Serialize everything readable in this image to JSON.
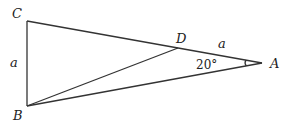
{
  "diagram": {
    "type": "geometry-triangle",
    "points": {
      "A": {
        "label": "A",
        "x": 262,
        "y": 63
      },
      "B": {
        "label": "B",
        "x": 27,
        "y": 106
      },
      "C": {
        "label": "C",
        "x": 27,
        "y": 21
      },
      "D": {
        "label": "D",
        "x": 178,
        "y": 48
      }
    },
    "segments": [
      "CB",
      "CA",
      "BA",
      "BD"
    ],
    "side_labels": {
      "CB": "a",
      "DA": "a"
    },
    "angle_label": "20°",
    "line_color": "#333333"
  }
}
